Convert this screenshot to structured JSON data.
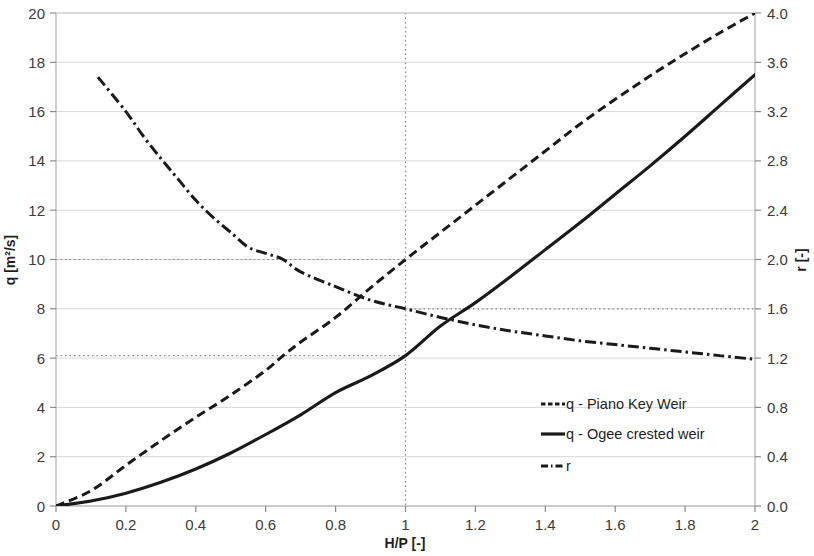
{
  "chart_data": {
    "type": "line",
    "title": "",
    "xlabel": "H/P [-]",
    "ylabel": "q [m²/s]",
    "y2label": "r [-]",
    "xlim": [
      0,
      2
    ],
    "ylim": [
      0,
      20
    ],
    "y2lim": [
      0.0,
      4.0
    ],
    "grid": true,
    "legend_position": "inside-right-lower",
    "xticks": [
      "0",
      "0.2",
      "0.4",
      "0.6",
      "0.8",
      "1",
      "1.2",
      "1.4",
      "1.6",
      "1.8",
      "2"
    ],
    "xtick_values": [
      0,
      0.2,
      0.4,
      0.6,
      0.8,
      1,
      1.2,
      1.4,
      1.6,
      1.8,
      2
    ],
    "yticks": [
      "0",
      "2",
      "4",
      "6",
      "8",
      "10",
      "12",
      "14",
      "16",
      "18",
      "20"
    ],
    "ytick_values": [
      0,
      2,
      4,
      6,
      8,
      10,
      12,
      14,
      16,
      18,
      20
    ],
    "y2ticks": [
      "0.0",
      "0.4",
      "0.8",
      "1.2",
      "1.6",
      "2.0",
      "2.4",
      "2.8",
      "3.2",
      "3.6",
      "4.0"
    ],
    "y2tick_values": [
      0.0,
      0.4,
      0.8,
      1.2,
      1.6,
      2.0,
      2.4,
      2.8,
      3.2,
      3.6,
      4.0
    ],
    "series": [
      {
        "name": "q - Piano Key Weir",
        "axis": "left",
        "style": "dashed",
        "color": "#1a1a1a",
        "x": [
          0,
          0.1,
          0.2,
          0.3,
          0.4,
          0.5,
          0.6,
          0.65,
          0.7,
          0.8,
          0.9,
          1.0,
          1.1,
          1.2,
          1.3,
          1.4,
          1.5,
          1.6,
          1.7,
          1.8,
          1.9,
          2.0
        ],
        "values": [
          0.0,
          0.62,
          1.65,
          2.65,
          3.6,
          4.5,
          5.5,
          6.1,
          6.65,
          7.65,
          8.85,
          10.0,
          11.1,
          12.2,
          13.3,
          14.4,
          15.5,
          16.5,
          17.45,
          18.35,
          19.2,
          20.0
        ]
      },
      {
        "name": "q - Ogee crested weir",
        "axis": "left",
        "style": "solid",
        "color": "#1a1a1a",
        "x": [
          0,
          0.1,
          0.2,
          0.3,
          0.4,
          0.5,
          0.6,
          0.7,
          0.8,
          0.9,
          1.0,
          1.1,
          1.2,
          1.3,
          1.4,
          1.5,
          1.6,
          1.7,
          1.8,
          1.9,
          2.0
        ],
        "values": [
          0.0,
          0.2,
          0.52,
          0.96,
          1.5,
          2.15,
          2.9,
          3.7,
          4.6,
          5.28,
          6.1,
          7.3,
          8.25,
          9.3,
          10.4,
          11.5,
          12.65,
          13.8,
          15.0,
          16.25,
          17.5
        ]
      },
      {
        "name": "r",
        "axis": "right",
        "style": "dashdot",
        "color": "#1a1a1a",
        "x": [
          0.12,
          0.2,
          0.25,
          0.3,
          0.35,
          0.4,
          0.45,
          0.5,
          0.55,
          0.6,
          0.65,
          0.7,
          0.8,
          0.9,
          1.0,
          1.1,
          1.2,
          1.3,
          1.4,
          1.5,
          1.6,
          1.7,
          1.8,
          1.9,
          2.0
        ],
        "values": [
          3.48,
          3.2,
          3.0,
          2.82,
          2.65,
          2.48,
          2.34,
          2.22,
          2.1,
          2.05,
          2.0,
          1.9,
          1.78,
          1.67,
          1.6,
          1.53,
          1.47,
          1.42,
          1.38,
          1.34,
          1.31,
          1.28,
          1.25,
          1.22,
          1.19
        ]
      }
    ],
    "reference_lines": [
      {
        "name": "x-reference",
        "orientation": "vertical",
        "x": 1.0,
        "style": "dotted"
      },
      {
        "name": "pkw-reference",
        "orientation": "horizontal",
        "y": 10.0,
        "style": "dotted",
        "from_x": 0,
        "to_x": 1.0
      },
      {
        "name": "r-reference",
        "orientation": "horizontal",
        "y": 8.0,
        "style": "dotted",
        "from_x": 1.0,
        "to_x": 2.0
      },
      {
        "name": "ogee-reference",
        "orientation": "horizontal",
        "y": 6.1,
        "style": "dotted",
        "from_x": 0,
        "to_x": 1.0
      }
    ]
  },
  "legend": {
    "items": [
      {
        "label": "q - Piano Key Weir",
        "style": "dashed"
      },
      {
        "label": "q - Ogee crested weir",
        "style": "solid"
      },
      {
        "label": "r",
        "style": "dashdot"
      }
    ]
  }
}
